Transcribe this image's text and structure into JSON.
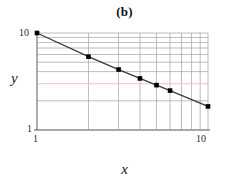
{
  "chart_data": {
    "type": "line",
    "title": "(b)",
    "xlabel": "x",
    "ylabel": "y",
    "xscale": "log",
    "yscale": "log",
    "xlim": [
      1,
      10
    ],
    "ylim": [
      1,
      10
    ],
    "grid": true,
    "grid_color": "#9aa0a6",
    "highlight_gridline_color": "#f0c0c8",
    "highlight_gridline_y": 3,
    "legend": "none",
    "marker": "filled-square",
    "marker_color": "#000000",
    "line_color": "#3a3a3a",
    "series": [
      {
        "name": "data",
        "x": [
          1,
          2,
          3,
          4,
          5,
          6,
          10
        ],
        "y": [
          10,
          5.7,
          4.2,
          3.4,
          2.9,
          2.55,
          1.75
        ]
      }
    ],
    "xticks": [
      1,
      10
    ],
    "xticklabels": [
      "1",
      "10"
    ],
    "yticks": [
      1,
      10
    ],
    "yticklabels": [
      "1",
      "10"
    ]
  },
  "axes": {
    "y_tick_top": "10",
    "y_tick_bottom": "1",
    "x_tick_left": "1",
    "x_tick_right": "10"
  }
}
